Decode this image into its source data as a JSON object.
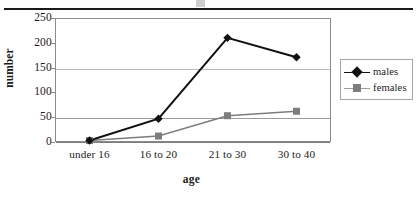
{
  "chart_data": {
    "type": "line",
    "title": "",
    "subtitle": "",
    "xlabel": "age",
    "ylabel": "number",
    "categories": [
      "under 16",
      "16 to 20",
      "21 to 30",
      "30 to 40"
    ],
    "series": [
      {
        "name": "males",
        "values": [
          3,
          47,
          210,
          171
        ],
        "color": "#111111",
        "marker": "diamond"
      },
      {
        "name": "females",
        "values": [
          3,
          12,
          53,
          62
        ],
        "color": "#7d7d7d",
        "marker": "square"
      }
    ],
    "ylim": [
      0,
      250
    ],
    "yticks": [
      0,
      50,
      100,
      150,
      200,
      250
    ],
    "grid": "horizontal",
    "legend_position": "right",
    "legend_entries": [
      "males",
      "females"
    ]
  },
  "axes": {
    "y_tick_labels": [
      "250",
      "200",
      "150",
      "100",
      "50",
      "0"
    ],
    "y_title": "number",
    "x_title": "age",
    "x_tick_labels": [
      "under 16",
      "16 to 20",
      "21 to 30",
      "30 to 40"
    ]
  },
  "legend": {
    "males_label": "males",
    "females_label": "females"
  },
  "colors": {
    "males": "#111111",
    "females": "#7d7d7d",
    "grid": "#bdbdbd",
    "frame": "#8a8a8a",
    "rule": "#1a1a1a"
  }
}
